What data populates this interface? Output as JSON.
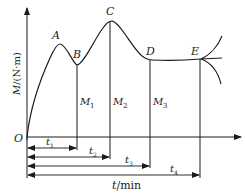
{
  "diagram": {
    "type": "torque-time curve",
    "y_axis": {
      "label_var": "M",
      "label_unit": "/(N·m)"
    },
    "x_axis": {
      "label_var": "t",
      "label_unit": "/min"
    },
    "origin": "O",
    "points": [
      {
        "name": "A",
        "label": "A"
      },
      {
        "name": "B",
        "label": "B"
      },
      {
        "name": "C",
        "label": "C"
      },
      {
        "name": "D",
        "label": "D"
      },
      {
        "name": "E",
        "label": "E"
      }
    ],
    "torques": [
      {
        "label": "M",
        "sub": "1"
      },
      {
        "label": "M",
        "sub": "2"
      },
      {
        "label": "M",
        "sub": "3"
      }
    ],
    "times": [
      {
        "label": "t",
        "sub": "1"
      },
      {
        "label": "t",
        "sub": "2"
      },
      {
        "label": "t",
        "sub": "3"
      },
      {
        "label": "t",
        "sub": "4"
      }
    ],
    "colors": {
      "line": "#1a1a1a",
      "background": "#ffffff"
    }
  }
}
